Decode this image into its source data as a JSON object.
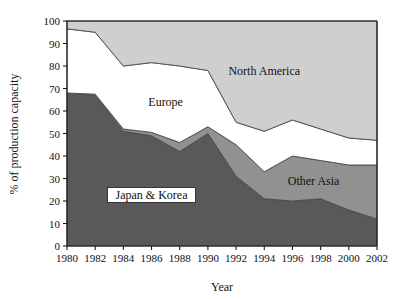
{
  "chart_data": {
    "type": "area",
    "stacked": true,
    "title": "",
    "xlabel": "Year",
    "ylabel": "% of production capacity",
    "categories": [
      1980,
      1982,
      1984,
      1986,
      1988,
      1990,
      1992,
      1994,
      1996,
      1998,
      2000,
      2002
    ],
    "x": [
      1980,
      1982,
      1984,
      1986,
      1988,
      1990,
      1992,
      1994,
      1996,
      1998,
      2000,
      2002
    ],
    "xlim": [
      1980,
      2002
    ],
    "ylim": [
      0,
      100
    ],
    "xticks": [
      1980,
      1982,
      1984,
      1986,
      1988,
      1990,
      1992,
      1994,
      1996,
      1998,
      2000,
      2002
    ],
    "xtick_labels": [
      "1980",
      "1982",
      "1984",
      "1986",
      "1988",
      "1990",
      "1992",
      "1994",
      "1996",
      "1998",
      "2000",
      "2002"
    ],
    "yticks": [
      0,
      10,
      20,
      30,
      40,
      50,
      60,
      70,
      80,
      90,
      100
    ],
    "ytick_labels": [
      "0",
      "10",
      "20",
      "30",
      "40",
      "50",
      "60",
      "70",
      "80",
      "90",
      "100"
    ],
    "grid": false,
    "legend": "inline-annotations",
    "series": [
      {
        "name": "Japan & Korea",
        "color": "#595959",
        "values": [
          68,
          67,
          51,
          49,
          42,
          50,
          31,
          21,
          20,
          21,
          16,
          12
        ]
      },
      {
        "name": "Other Asia",
        "color": "#919191",
        "values": [
          0,
          0.5,
          1,
          1.5,
          4,
          3,
          14,
          12,
          20,
          17,
          20,
          24
        ]
      },
      {
        "name": "Europe",
        "color": "#ffffff",
        "values": [
          28.5,
          27.5,
          28,
          31,
          34,
          25,
          10,
          18,
          16,
          14,
          12,
          11
        ]
      },
      {
        "name": "North America",
        "color": "#cfcfcf",
        "values": [
          3.5,
          5,
          20,
          18.5,
          20,
          22,
          45,
          49,
          44,
          48,
          52,
          53
        ]
      }
    ],
    "cumulative_tops": {
      "Japan & Korea": [
        68,
        67,
        51,
        49,
        42,
        50,
        31,
        21,
        20,
        21,
        16,
        12
      ],
      "Other Asia": [
        68,
        67.5,
        52,
        50.5,
        46,
        53,
        45,
        33,
        40,
        38,
        36,
        36
      ],
      "Europe": [
        96.5,
        95,
        80,
        81.5,
        80,
        78,
        55,
        51,
        56,
        52,
        48,
        47
      ],
      "North America": [
        100,
        100,
        100,
        100,
        100,
        100,
        100,
        100,
        100,
        100,
        100,
        100
      ]
    },
    "annotations": [
      {
        "text": "North America",
        "x": 1994,
        "y": 77,
        "boxed": false
      },
      {
        "text": "Europe",
        "x": 1987,
        "y": 63,
        "boxed": false
      },
      {
        "text": "Other Asia",
        "x": 1997.5,
        "y": 28,
        "boxed": false
      },
      {
        "text": "Japan & Korea",
        "x": 1986,
        "y": 22,
        "boxed": true
      }
    ],
    "colors": {
      "japan_korea": "#595959",
      "other_asia": "#919191",
      "europe": "#ffffff",
      "north_america": "#cfcfcf",
      "axis": "#1a1a1a",
      "background": "#ffffff"
    }
  }
}
